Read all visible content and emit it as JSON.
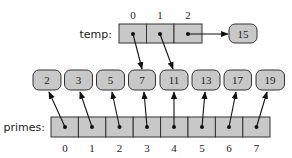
{
  "temp": {
    "label": "temp:",
    "indices": [
      "0",
      "1",
      "2"
    ],
    "targets": [
      "7",
      "11",
      "15"
    ]
  },
  "extra_node": {
    "value": "15"
  },
  "nodes": [
    "2",
    "3",
    "5",
    "7",
    "11",
    "13",
    "17",
    "19"
  ],
  "primes": {
    "label": "primes:",
    "indices": [
      "0",
      "1",
      "2",
      "3",
      "4",
      "5",
      "6",
      "7"
    ]
  },
  "colors": {
    "cell_fill": "#c8c8c8",
    "stroke": "#333333",
    "pointer": "#111111"
  }
}
